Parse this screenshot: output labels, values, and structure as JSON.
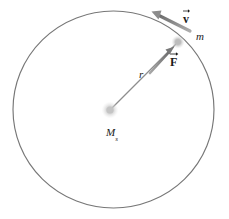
{
  "figure": {
    "type": "physics-orbit-diagram",
    "background_color": "#ffffff",
    "stroke_color": "#6e6e6e",
    "vector_color": "#8a8a8a",
    "label_color": "#1a1a1a"
  },
  "geometry": {
    "orbit": {
      "center_x": 113.5,
      "center_y": 109.5,
      "radius_x": 100.5,
      "radius_y": 98.5,
      "stroke_width": 1.1
    },
    "central_body": {
      "cx": 110,
      "cy": 110,
      "r": 5.5,
      "color": "#c9c9c9"
    },
    "orbiting_body": {
      "cx": 178,
      "cy": 42,
      "r": 4.2,
      "color": "#b4b4b4"
    },
    "radius_line": {
      "x1": 112,
      "y1": 108,
      "x2": 176,
      "y2": 44
    },
    "force_vector": {
      "tail_x": 152,
      "tail_y": 71,
      "head_x": 172,
      "head_y": 49,
      "direction": "toward-central-mass-reversed"
    },
    "velocity_vector": {
      "tail_x": 190,
      "tail_y": 30,
      "head_x": 152,
      "head_y": 12,
      "direction": "tangent-up-left"
    }
  },
  "labels": {
    "velocity": "v",
    "force": "F",
    "orbiting_mass": "m",
    "radius": "r",
    "central_mass": "M",
    "central_mass_subscript": "s"
  }
}
